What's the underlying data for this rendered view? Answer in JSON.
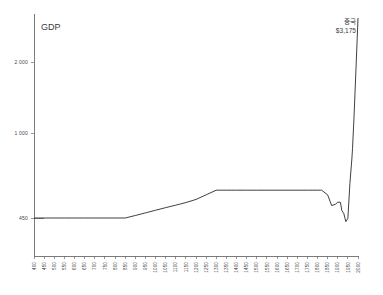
{
  "chart_data": {
    "type": "line",
    "title": "",
    "subtitle": "",
    "ylabel": "GDP",
    "xlabel": "",
    "grid": false,
    "legend": "none",
    "xlim": [
      400,
      2000
    ],
    "ylim": [
      400,
      3175
    ],
    "ytick_labels": [
      "2 000",
      "1 000",
      "450"
    ],
    "ytick_values": [
      2000,
      1000,
      450
    ],
    "xtick_labels": [
      "400",
      "450",
      "500",
      "550",
      "600",
      "650",
      "700",
      "750",
      "800",
      "850",
      "900",
      "950",
      "1000",
      "1050",
      "1100",
      "1150",
      "1200",
      "1250",
      "1300",
      "1350",
      "1400",
      "1450",
      "1500",
      "1550",
      "1600",
      "1650",
      "1700",
      "1750",
      "1800",
      "1850",
      "1900",
      "1950",
      "2000"
    ],
    "xtick_values": [
      400,
      450,
      500,
      550,
      600,
      650,
      700,
      750,
      800,
      850,
      900,
      950,
      1000,
      1050,
      1100,
      1150,
      1200,
      1250,
      1300,
      1350,
      1400,
      1450,
      1500,
      1550,
      1600,
      1650,
      1700,
      1750,
      1800,
      1850,
      1900,
      1950,
      2000
    ],
    "series": [
      {
        "name": "GDP",
        "color": "#1d1d1d",
        "x": [
          400,
          450,
          500,
          550,
          600,
          650,
          700,
          750,
          800,
          850,
          900,
          950,
          1000,
          1050,
          1100,
          1150,
          1200,
          1250,
          1300,
          1350,
          1400,
          1450,
          1500,
          1550,
          1600,
          1650,
          1700,
          1750,
          1800,
          1820,
          1850,
          1870,
          1890,
          1900,
          1913,
          1920,
          1930,
          1940,
          1950,
          1960,
          1970,
          1973,
          1980,
          1990,
          2000
        ],
        "y": [
          450,
          450,
          450,
          450,
          450,
          450,
          450,
          450,
          450,
          450,
          466,
          483,
          500,
          517,
          533,
          550,
          570,
          600,
          630,
          630,
          630,
          630,
          630,
          630,
          630,
          630,
          630,
          630,
          630,
          630,
          600,
          530,
          540,
          552,
          552,
          500,
          478,
          430,
          448,
          673,
          838,
          900,
          1200,
          1900,
          3175
        ]
      }
    ],
    "annotations": [
      {
        "name": "china-label",
        "line1": "중국",
        "line2": "$3,175",
        "value": 3175,
        "at_x": 2000
      }
    ]
  },
  "axis_title": {
    "gdp": "GDP"
  }
}
